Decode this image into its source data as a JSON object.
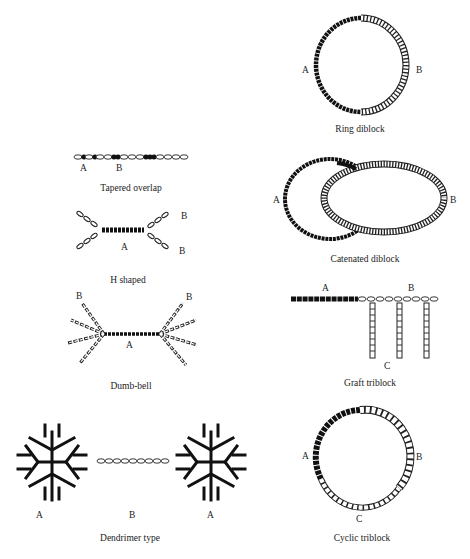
{
  "figure": {
    "panels": [
      {
        "id": "tapered-overlap",
        "caption": "Tapered overlap",
        "labels": [
          "A",
          "B"
        ]
      },
      {
        "id": "h-shaped",
        "caption": "H shaped",
        "labels": [
          "A",
          "B",
          "B"
        ]
      },
      {
        "id": "dumb-bell",
        "caption": "Dumb-bell",
        "labels": [
          "A",
          "B",
          "B"
        ]
      },
      {
        "id": "dendrimer-type",
        "caption": "Dendrimer type",
        "labels": [
          "A",
          "B",
          "A"
        ]
      },
      {
        "id": "ring-diblock",
        "caption": "Ring diblock",
        "labels": [
          "A",
          "B"
        ]
      },
      {
        "id": "catenated-diblock",
        "caption": "Catenated diblock",
        "labels": [
          "A",
          "B"
        ]
      },
      {
        "id": "graft-triblock",
        "caption": "Graft triblock",
        "labels": [
          "A",
          "B",
          "C"
        ]
      },
      {
        "id": "cyclic-triblock",
        "caption": "Cyclic triblock",
        "labels": [
          "A",
          "B",
          "C"
        ]
      }
    ],
    "colors": {
      "block_a": "#111111",
      "block_b": "#ffffff",
      "stroke": "#222222"
    }
  }
}
